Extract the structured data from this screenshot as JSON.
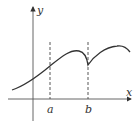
{
  "diagram": {
    "axes": {
      "x_label": "x",
      "y_label": "y"
    },
    "marks": [
      {
        "label": "a",
        "x": 50
      },
      {
        "label": "b",
        "x": 88
      }
    ],
    "colors": {
      "stroke": "#333333",
      "dash": "#444444"
    }
  }
}
